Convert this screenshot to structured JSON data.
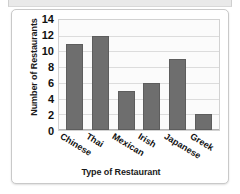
{
  "chart_data": {
    "type": "bar",
    "title": "",
    "xlabel": "Type of Restaurant",
    "ylabel": "Number of Restaurants",
    "categories": [
      "Chinese",
      "Thai",
      "Mexican",
      "Irish",
      "Japanese",
      "Greek"
    ],
    "values": [
      11,
      12,
      5,
      6,
      9,
      2
    ],
    "ylim": [
      0,
      14
    ],
    "ytick_values": [
      14,
      12,
      10,
      8,
      6,
      4,
      2,
      0
    ],
    "ytick_step": 2,
    "grid": "horizontal",
    "legend": "none",
    "bar_color": "#6e6e6e",
    "plot_background": "#fbfbfb",
    "x_tick_label_rotation_deg": -31
  }
}
